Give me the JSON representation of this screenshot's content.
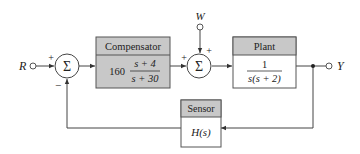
{
  "diagram": {
    "type": "block-diagram",
    "input": {
      "label": "R"
    },
    "disturbance": {
      "label": "W"
    },
    "output": {
      "label": "Y"
    },
    "summing_junction_1": {
      "symbol": "Σ",
      "signs": {
        "input": "+",
        "feedback": "−"
      }
    },
    "summing_junction_2": {
      "symbol": "Σ",
      "signs": {
        "input": "+",
        "disturbance": "+"
      }
    },
    "compensator": {
      "title": "Compensator",
      "gain": "160",
      "numerator": "s + 4",
      "denominator": "s + 30",
      "header_color": "#c8c8c8",
      "body_color": "#c8c8c8"
    },
    "plant": {
      "title": "Plant",
      "numerator": "1",
      "denominator": "s(s + 2)",
      "header_color": "#c8c8c8",
      "body_color": "#ffffff"
    },
    "sensor": {
      "title": "Sensor",
      "transfer": "H(s)",
      "header_color": "#c8c8c8",
      "body_color": "#ffffff"
    }
  }
}
